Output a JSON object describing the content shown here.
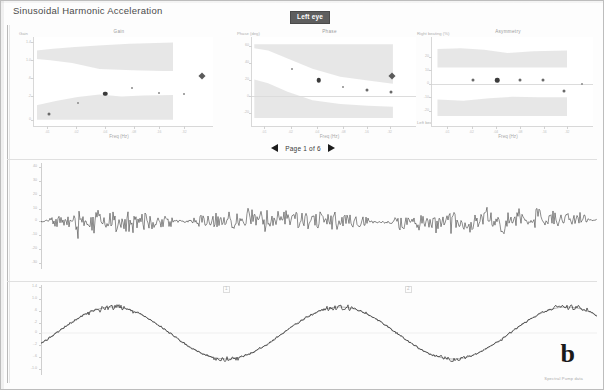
{
  "header": {
    "app_title": "Sinusoidal Harmonic Acceleration",
    "eye_badge": "Left eye"
  },
  "pager": {
    "prev_icon": "triangle-left-icon",
    "next_icon": "triangle-right-icon",
    "label": "Page 1 of 6"
  },
  "figure": {
    "panel_label": "b",
    "watermark": "Spectral Pump data"
  },
  "chart_data": [
    {
      "id": "gain",
      "type": "scatter",
      "title": "Gain",
      "xlabel": "Freq (Hz)",
      "ylabel": "Gain",
      "grid": false,
      "legend": null,
      "xlim": [
        0.01,
        1.0
      ],
      "ylim": [
        0,
        1.4
      ],
      "xticks": [
        0.01,
        0.02,
        0.04,
        0.08,
        0.16,
        0.32,
        0.64
      ],
      "xtick_labels": [
        "0.01",
        "0.02",
        "0.04",
        "0.08",
        "0.16",
        "0.32",
        "0.64"
      ],
      "yticks": [
        0,
        0.2,
        0.4,
        0.6,
        0.8,
        1.0,
        1.2,
        1.4
      ],
      "ytick_labels": [
        "0",
        ".2",
        ".4",
        ".6",
        ".8",
        "1.0",
        "1.2",
        "1.4"
      ],
      "norm_band_upper": {
        "label": "upper normative band",
        "y_low": 0.62,
        "y_high": 1.25
      },
      "norm_band_lower": {
        "label": "lower normative band",
        "y_low": 0.0,
        "y_high": 0.42
      },
      "x": [
        0.01,
        0.02,
        0.04,
        0.08,
        0.16,
        0.32,
        0.64
      ],
      "values": [
        0.06,
        0.26,
        0.42,
        0.52,
        0.45,
        0.44,
        0.44
      ],
      "point_sizes": [
        "md",
        "sm",
        "lg",
        "sm",
        "sm",
        "sm",
        "sm"
      ],
      "extra_marker": {
        "type": "diamond",
        "x": 0.95,
        "y": 1.22
      }
    },
    {
      "id": "phase",
      "type": "scatter",
      "title": "Phase",
      "xlabel": "Freq (Hz)",
      "ylabel": "Phase (deg)",
      "grid": false,
      "legend": null,
      "xlim": [
        0.01,
        1.0
      ],
      "ylim": [
        -40,
        60
      ],
      "xticks": [
        0.01,
        0.02,
        0.04,
        0.08,
        0.16,
        0.32,
        0.64
      ],
      "xtick_labels": [
        "0.01",
        "0.02",
        "0.04",
        "0.08",
        "0.16",
        "0.32",
        "0.64"
      ],
      "yticks": [
        -40,
        -20,
        0,
        20,
        40,
        60
      ],
      "ytick_labels": [
        "-40",
        "-20",
        "0",
        "20",
        "40",
        "60"
      ],
      "norm_band_upper": {
        "label": "upper normative band",
        "y_low": 8,
        "y_high": 58
      },
      "norm_band_lower": {
        "label": "lower normative band",
        "y_low": -38,
        "y_high": 2
      },
      "x": [
        0.02,
        0.04,
        0.08,
        0.16,
        0.32,
        0.64
      ],
      "values": [
        34,
        22,
        13,
        9,
        7,
        6
      ],
      "point_sizes": [
        "sm",
        "lg",
        "sm",
        "md",
        "md",
        "md"
      ],
      "extra_marker": {
        "type": "diamond",
        "x": 0.95,
        "y": 52
      }
    },
    {
      "id": "asymmetry",
      "type": "scatter",
      "title": "Asymmetry",
      "xlabel": "Freq (Hz)",
      "ylabel": "Right beating (%)",
      "ylabel_bottom": "Left beating (%)",
      "grid": false,
      "legend": null,
      "xlim": [
        0.01,
        1.0
      ],
      "ylim": [
        -40,
        40
      ],
      "xticks": [
        0.01,
        0.02,
        0.04,
        0.08,
        0.16,
        0.32,
        0.64
      ],
      "xtick_labels": [
        "0.01",
        "0.02",
        "0.04",
        "0.08",
        "0.16",
        "0.32",
        "0.64"
      ],
      "yticks": [
        -40,
        -30,
        -20,
        -10,
        0,
        10,
        20,
        30,
        40
      ],
      "ytick_labels": [
        "-40",
        "-30",
        "-20",
        "-10",
        "0",
        "10",
        "20",
        "30",
        "40"
      ],
      "norm_band_upper": {
        "label": "upper normative band",
        "y_low": 18,
        "y_high": 38
      },
      "norm_band_lower": {
        "label": "lower normative band",
        "y_low": -38,
        "y_high": -16
      },
      "x": [
        0.02,
        0.04,
        0.08,
        0.16,
        0.32,
        0.64
      ],
      "values": [
        2,
        3,
        2,
        2,
        -4,
        0
      ],
      "point_sizes": [
        "md",
        "lg",
        "md",
        "md",
        "md",
        "sm"
      ],
      "extra_marker": null
    },
    {
      "id": "eye-velocity-trace",
      "type": "line",
      "title": "Eye velocity",
      "xlabel": "Time",
      "ylabel": "deg/s",
      "grid": false,
      "yticks": [
        -40,
        -30,
        -20,
        -10,
        0,
        10,
        20,
        30,
        40
      ],
      "ytick_labels": [
        "40",
        "30",
        "20",
        "10",
        "0",
        "-10",
        "-20",
        "-30",
        "-40"
      ],
      "description": "Noisy nystagmus eye-velocity recording with saccadic beats across three burst groups"
    },
    {
      "id": "head-position-trace",
      "type": "line",
      "title": "Head position / slow phase velocity",
      "xlabel": "Time",
      "ylabel": "deg",
      "grid": false,
      "yticks": [
        -1.4,
        -1.0,
        -0.6,
        -0.2,
        0.2,
        0.6,
        1.0,
        1.4
      ],
      "ytick_labels": [
        "1.4",
        "1.0",
        ".6",
        ".2",
        "0",
        "-.2",
        "-.6",
        "-1.0"
      ],
      "top_tick_label": "1.4",
      "bottom_tick_label": "-1.4",
      "description": "Smooth sinusoidal head/eye position trace, about 2.5 cycles, overlaid with noisy measured signal and fitted sine"
    }
  ]
}
